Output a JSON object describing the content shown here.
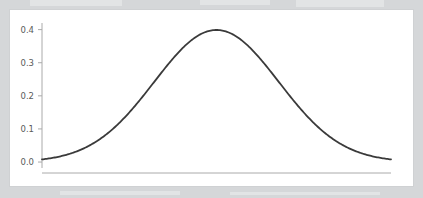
{
  "figure": {
    "background_color": "#d5d7d9",
    "panel_color": "#ffffff",
    "panel_border_color": "#cfd1d3"
  },
  "chart_data": {
    "type": "line",
    "title": "",
    "subtitle": "",
    "xlabel": "",
    "ylabel": "",
    "curve_name": "standard-normal-pdf",
    "line_color": "#3a3a3a",
    "line_width": 1.8,
    "axis_color": "#aaaaaa",
    "tick_color": "#aaaaaa",
    "tick_label_color": "#5a5a5a",
    "grid": false,
    "legend": null,
    "legend_position": "none",
    "x_axis_visible_spine": true,
    "x_tick_labels": [],
    "xlim": [
      -2.8,
      2.8
    ],
    "ylim": [
      -0.018,
      0.42
    ],
    "y_ticks": [
      0.0,
      0.1,
      0.2,
      0.3,
      0.4
    ],
    "y_tick_labels": [
      "0.0",
      "0.1",
      "0.2",
      "0.3",
      "0.4"
    ],
    "x": [
      -2.8,
      -2.6,
      -2.4,
      -2.2,
      -2.0,
      -1.8,
      -1.6,
      -1.4,
      -1.2,
      -1.0,
      -0.8,
      -0.6,
      -0.4,
      -0.2,
      0.0,
      0.2,
      0.4,
      0.6,
      0.8,
      1.0,
      1.2,
      1.4,
      1.6,
      1.8,
      2.0,
      2.2,
      2.4,
      2.6,
      2.8
    ],
    "y": [
      0.008,
      0.014,
      0.022,
      0.035,
      0.054,
      0.079,
      0.111,
      0.15,
      0.194,
      0.242,
      0.29,
      0.333,
      0.368,
      0.391,
      0.399,
      0.391,
      0.368,
      0.333,
      0.29,
      0.242,
      0.194,
      0.15,
      0.111,
      0.079,
      0.054,
      0.035,
      0.022,
      0.014,
      0.008
    ],
    "peak": {
      "x": 0.0,
      "y": 0.399
    },
    "annotations": []
  }
}
